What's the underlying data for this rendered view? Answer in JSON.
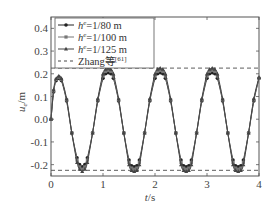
{
  "chart_data": {
    "type": "line",
    "title": "",
    "xlabel": "t/s",
    "ylabel": "u_e/m",
    "xlim": [
      0,
      4
    ],
    "ylim": [
      -0.25,
      0.45
    ],
    "xticks": [
      0,
      1,
      2,
      3,
      4
    ],
    "xtick_labels": [
      "0",
      "1",
      "2",
      "3",
      "4"
    ],
    "yticks": [
      -0.2,
      -0.1,
      0.0,
      0.1,
      0.2,
      0.3,
      0.4
    ],
    "ytick_labels": [
      "-0.2",
      "-0.1",
      "0.0",
      "0.1",
      "0.2",
      "0.3",
      "0.4"
    ],
    "grid": false,
    "legend_position": "upper left",
    "series": [
      {
        "name": "h^e=1/80 m",
        "marker": "circle",
        "color": "#222222",
        "x": [
          0,
          0.05,
          0.1,
          0.15,
          0.2,
          0.3,
          0.4,
          0.5,
          0.55,
          0.6,
          0.65,
          0.7,
          0.8,
          0.9,
          1.0,
          1.05,
          1.1,
          1.15,
          1.2,
          1.3,
          1.4,
          1.5,
          1.55,
          1.6,
          1.65,
          1.7,
          1.8,
          1.9,
          2.0,
          2.05,
          2.1,
          2.15,
          2.2,
          2.3,
          2.4,
          2.5,
          2.55,
          2.6,
          2.65,
          2.7,
          2.8,
          2.9,
          3.0,
          3.05,
          3.1,
          3.15,
          3.2,
          3.3,
          3.4,
          3.5,
          3.55,
          3.6,
          3.65,
          3.7,
          3.8,
          3.9,
          4.0
        ],
        "y": [
          0.0,
          0.12,
          0.17,
          0.18,
          0.17,
          0.08,
          -0.06,
          -0.17,
          -0.2,
          -0.21,
          -0.2,
          -0.17,
          -0.06,
          0.08,
          0.18,
          0.2,
          0.205,
          0.2,
          0.18,
          0.08,
          -0.06,
          -0.18,
          -0.205,
          -0.21,
          -0.205,
          -0.18,
          -0.06,
          0.08,
          0.18,
          0.2,
          0.205,
          0.2,
          0.18,
          0.08,
          -0.06,
          -0.18,
          -0.205,
          -0.21,
          -0.205,
          -0.18,
          -0.06,
          0.08,
          0.18,
          0.2,
          0.205,
          0.2,
          0.18,
          0.08,
          -0.06,
          -0.18,
          -0.205,
          -0.21,
          -0.205,
          -0.18,
          -0.06,
          0.08,
          0.18
        ]
      },
      {
        "name": "h^e=1/100 m",
        "marker": "square",
        "color": "#777777",
        "x": [
          0,
          0.05,
          0.1,
          0.15,
          0.2,
          0.3,
          0.4,
          0.5,
          0.55,
          0.6,
          0.65,
          0.7,
          0.8,
          0.9,
          1.0,
          1.05,
          1.1,
          1.15,
          1.2,
          1.3,
          1.4,
          1.5,
          1.55,
          1.6,
          1.65,
          1.7,
          1.8,
          1.9,
          2.0,
          2.05,
          2.1,
          2.15,
          2.2,
          2.3,
          2.4,
          2.5,
          2.55,
          2.6,
          2.65,
          2.7,
          2.8,
          2.9,
          3.0,
          3.05,
          3.1,
          3.15,
          3.2,
          3.3,
          3.4,
          3.5,
          3.55,
          3.6,
          3.65,
          3.7,
          3.8,
          3.9,
          4.0
        ],
        "y": [
          0.0,
          0.125,
          0.175,
          0.185,
          0.175,
          0.085,
          -0.06,
          -0.18,
          -0.21,
          -0.22,
          -0.21,
          -0.18,
          -0.06,
          0.085,
          0.19,
          0.21,
          0.215,
          0.21,
          0.19,
          0.085,
          -0.06,
          -0.19,
          -0.215,
          -0.22,
          -0.215,
          -0.19,
          -0.06,
          0.085,
          0.19,
          0.21,
          0.215,
          0.21,
          0.19,
          0.085,
          -0.06,
          -0.19,
          -0.215,
          -0.22,
          -0.215,
          -0.19,
          -0.06,
          0.085,
          0.19,
          0.21,
          0.215,
          0.21,
          0.19,
          0.085,
          -0.06,
          -0.19,
          -0.215,
          -0.22,
          -0.215,
          -0.19,
          -0.06,
          0.085,
          0.18
        ]
      },
      {
        "name": "h^e=1/125 m",
        "marker": "triangle",
        "color": "#444444",
        "x": [
          0,
          0.05,
          0.1,
          0.15,
          0.2,
          0.3,
          0.4,
          0.5,
          0.55,
          0.6,
          0.65,
          0.7,
          0.8,
          0.9,
          1.0,
          1.05,
          1.1,
          1.15,
          1.2,
          1.3,
          1.4,
          1.5,
          1.55,
          1.6,
          1.65,
          1.7,
          1.8,
          1.9,
          2.0,
          2.05,
          2.1,
          2.15,
          2.2,
          2.3,
          2.4,
          2.5,
          2.55,
          2.6,
          2.65,
          2.7,
          2.8,
          2.9,
          3.0,
          3.05,
          3.1,
          3.15,
          3.2,
          3.3,
          3.4,
          3.5,
          3.55,
          3.6,
          3.65,
          3.7,
          3.8,
          3.9,
          4.0
        ],
        "y": [
          0.0,
          0.13,
          0.18,
          0.19,
          0.18,
          0.09,
          -0.06,
          -0.19,
          -0.22,
          -0.23,
          -0.22,
          -0.19,
          -0.06,
          0.09,
          0.2,
          0.22,
          0.225,
          0.22,
          0.2,
          0.09,
          -0.06,
          -0.2,
          -0.225,
          -0.23,
          -0.225,
          -0.2,
          -0.06,
          0.09,
          0.2,
          0.22,
          0.225,
          0.22,
          0.2,
          0.09,
          -0.06,
          -0.2,
          -0.225,
          -0.23,
          -0.225,
          -0.2,
          -0.06,
          0.09,
          0.2,
          0.22,
          0.225,
          0.22,
          0.2,
          0.09,
          -0.06,
          -0.2,
          -0.225,
          -0.23,
          -0.225,
          -0.2,
          -0.06,
          0.09,
          0.185
        ]
      },
      {
        "name": "Zhang等[61]",
        "marker": "none",
        "line_style": "dashed",
        "color": "#333333",
        "reference_lines": [
          0.225,
          -0.225
        ]
      }
    ]
  },
  "legend": {
    "items": [
      {
        "prefix": "h",
        "sup": "e",
        "suffix": "=1/80 m",
        "marker": "circle"
      },
      {
        "prefix": "h",
        "sup": "e",
        "suffix": "=1/100 m",
        "marker": "square"
      },
      {
        "prefix": "h",
        "sup": "e",
        "suffix": "=1/125 m",
        "marker": "triangle"
      },
      {
        "prefix": "Zhang等",
        "sup": "[61]",
        "suffix": "",
        "marker": "dash"
      }
    ]
  },
  "axes": {
    "xlabel_italic": "t",
    "xlabel_rest": "/s",
    "ylabel_italic": "u",
    "ylabel_sub": "e",
    "ylabel_rest": "/m"
  }
}
